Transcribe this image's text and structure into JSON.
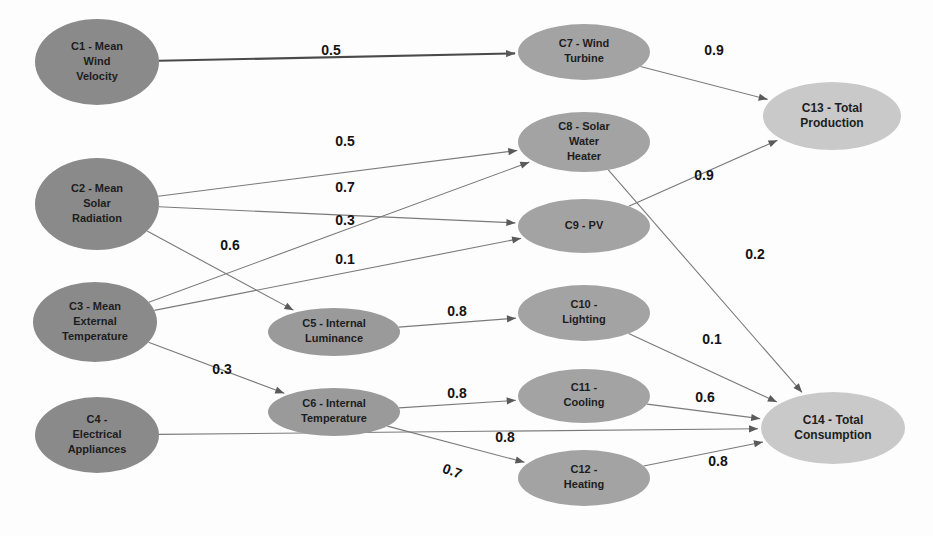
{
  "diagram": {
    "type": "fuzzy-cognitive-map",
    "background_color": "#fdfdfd",
    "node_color_input": "#8a8a8a",
    "node_color_middle": "#a0a0a0",
    "node_color_output": "#c9c9c9",
    "edge_color": "#7a7a7a"
  },
  "nodes": [
    {
      "id": "C1",
      "label": "C1 - Mean\nWind\nVelocity",
      "lines": [
        "C1 - Mean",
        "Wind",
        "Velocity"
      ],
      "cx": 97,
      "cy": 62,
      "rx": 62,
      "ry": 43,
      "group": "input",
      "fill": "#8a8a8a"
    },
    {
      "id": "C2",
      "label": "C2 - Mean\nSolar\nRadiation",
      "lines": [
        "C2 - Mean",
        "Solar",
        "Radiation"
      ],
      "cx": 97,
      "cy": 204,
      "rx": 62,
      "ry": 46,
      "group": "input",
      "fill": "#8a8a8a"
    },
    {
      "id": "C3",
      "label": "C3 - Mean\nExternal\nTemperature",
      "lines": [
        "C3 - Mean",
        "External",
        "Temperature"
      ],
      "cx": 95,
      "cy": 322,
      "rx": 62,
      "ry": 40,
      "group": "input",
      "fill": "#8a8a8a"
    },
    {
      "id": "C4",
      "label": "C4 -\nElectrical\nAppliances",
      "lines": [
        "C4 -",
        "Electrical",
        "Appliances"
      ],
      "cx": 97,
      "cy": 435,
      "rx": 62,
      "ry": 38,
      "group": "input",
      "fill": "#8a8a8a"
    },
    {
      "id": "C5",
      "label": "C5 - Internal\nLuminance",
      "lines": [
        "C5 - Internal",
        "Luminance"
      ],
      "cx": 334,
      "cy": 332,
      "rx": 66,
      "ry": 24,
      "group": "middle",
      "fill": "#9a9a9a"
    },
    {
      "id": "C6",
      "label": "C6 - Internal\nTemperature",
      "lines": [
        "C6 - Internal",
        "Temperature"
      ],
      "cx": 334,
      "cy": 412,
      "rx": 66,
      "ry": 24,
      "group": "middle",
      "fill": "#9a9a9a"
    },
    {
      "id": "C7",
      "label": "C7 - Wind\nTurbine",
      "lines": [
        "C7 - Wind",
        "Turbine"
      ],
      "cx": 584,
      "cy": 52,
      "rx": 66,
      "ry": 28,
      "group": "middle",
      "fill": "#a3a3a3"
    },
    {
      "id": "C8",
      "label": "C8 - Solar\nWater\nHeater",
      "lines": [
        "C8 - Solar",
        "Water",
        "Heater"
      ],
      "cx": 584,
      "cy": 142,
      "rx": 66,
      "ry": 30,
      "group": "middle",
      "fill": "#a3a3a3"
    },
    {
      "id": "C9",
      "label": "C9 - PV",
      "lines": [
        "C9 - PV"
      ],
      "cx": 584,
      "cy": 226,
      "rx": 66,
      "ry": 27,
      "group": "middle",
      "fill": "#a3a3a3"
    },
    {
      "id": "C10",
      "label": "C10 -\nLighting",
      "lines": [
        "C10 -",
        "Lighting"
      ],
      "cx": 584,
      "cy": 313,
      "rx": 66,
      "ry": 28,
      "group": "middle",
      "fill": "#a3a3a3"
    },
    {
      "id": "C11",
      "label": "C11 -\nCooling",
      "lines": [
        "C11 -",
        "Cooling"
      ],
      "cx": 584,
      "cy": 396,
      "rx": 66,
      "ry": 27,
      "group": "middle",
      "fill": "#a3a3a3"
    },
    {
      "id": "C12",
      "label": "C12 -\nHeating",
      "lines": [
        "C12 -",
        "Heating"
      ],
      "cx": 584,
      "cy": 478,
      "rx": 66,
      "ry": 28,
      "group": "middle",
      "fill": "#a3a3a3"
    },
    {
      "id": "C13",
      "label": "C13 - Total\nProduction",
      "lines": [
        "C13 - Total",
        "Production"
      ],
      "cx": 832,
      "cy": 116,
      "rx": 69,
      "ry": 34,
      "group": "output",
      "fill": "#c9c9c9"
    },
    {
      "id": "C14",
      "label": "C14 - Total\nConsumption",
      "lines": [
        "C14 - Total",
        "Consumption"
      ],
      "cx": 833,
      "cy": 428,
      "rx": 72,
      "ry": 36,
      "group": "output",
      "fill": "#c9c9c9"
    }
  ],
  "edges": [
    {
      "from": "C1",
      "to": "C7",
      "weight": "0.5",
      "lx": 331,
      "ly": 51,
      "thick": true,
      "rotate": 0
    },
    {
      "from": "C2",
      "to": "C8",
      "weight": "0.5",
      "lx": 345,
      "ly": 142,
      "thick": false,
      "rotate": 0
    },
    {
      "from": "C2",
      "to": "C9",
      "weight": "0.7",
      "lx": 345,
      "ly": 188,
      "thick": false,
      "rotate": 0
    },
    {
      "from": "C3",
      "to": "C8",
      "weight": "0.3",
      "lx": 345,
      "ly": 221,
      "thick": false,
      "rotate": 0
    },
    {
      "from": "C3",
      "to": "C9",
      "weight": "0.1",
      "lx": 345,
      "ly": 260,
      "thick": false,
      "rotate": 0
    },
    {
      "from": "C2",
      "to": "C5",
      "weight": "0.6",
      "lx": 230,
      "ly": 246,
      "thick": false,
      "rotate": 0
    },
    {
      "from": "C3",
      "to": "C6",
      "weight": "0.3",
      "lx": 222,
      "ly": 370,
      "thick": false,
      "rotate": 0
    },
    {
      "from": "C4",
      "to": "C14",
      "weight": "0.8",
      "lx": 505,
      "ly": 438,
      "thick": false,
      "rotate": 0
    },
    {
      "from": "C5",
      "to": "C10",
      "weight": "0.8",
      "lx": 457,
      "ly": 312,
      "thick": false,
      "rotate": 0
    },
    {
      "from": "C6",
      "to": "C11",
      "weight": "0.8",
      "lx": 457,
      "ly": 394,
      "thick": false,
      "rotate": 0
    },
    {
      "from": "C6",
      "to": "C12",
      "weight": "0.7",
      "lx": 452,
      "ly": 472,
      "thick": false,
      "rotate": 20
    },
    {
      "from": "C7",
      "to": "C13",
      "weight": "0.9",
      "lx": 714,
      "ly": 51,
      "thick": false,
      "rotate": 0
    },
    {
      "from": "C9",
      "to": "C13",
      "weight": "0.9",
      "lx": 704,
      "ly": 176,
      "thick": false,
      "rotate": 0
    },
    {
      "from": "C8",
      "to": "C14",
      "weight": "0.2",
      "lx": 755,
      "ly": 255,
      "thick": false,
      "rotate": 0
    },
    {
      "from": "C10",
      "to": "C14",
      "weight": "0.1",
      "lx": 712,
      "ly": 340,
      "thick": false,
      "rotate": 0
    },
    {
      "from": "C11",
      "to": "C14",
      "weight": "0.6",
      "lx": 705,
      "ly": 398,
      "thick": false,
      "rotate": 0
    },
    {
      "from": "C12",
      "to": "C14",
      "weight": "0.8",
      "lx": 718,
      "ly": 462,
      "thick": false,
      "rotate": 0
    }
  ]
}
